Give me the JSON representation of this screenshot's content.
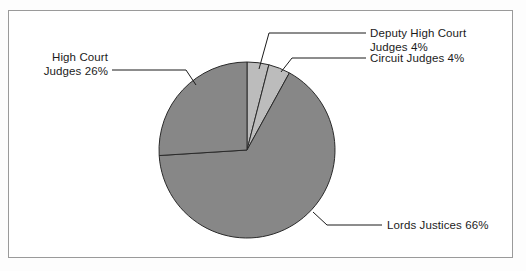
{
  "figure": {
    "background_color": "#ffffff",
    "frame_color": "#9a9a9a"
  },
  "chart_data": {
    "type": "pie",
    "title": "",
    "subtitle": "",
    "xlabel": "",
    "ylabel": "",
    "legend_position": "none",
    "grid": false,
    "start_angle_deg": 0,
    "direction": "clockwise",
    "center": {
      "x": 247,
      "y": 150
    },
    "radius": 88,
    "categories": [
      "Deputy High Court Judges",
      "Circuit Judges",
      "Lords Justices",
      "High Court Judges"
    ],
    "values": [
      4,
      4,
      66,
      26
    ],
    "unit": "%",
    "slices": [
      {
        "label": "Deputy High Court Judges",
        "value": 4,
        "value_text": "4%",
        "color": "#bcbcbc",
        "label_line1": "Deputy High Court",
        "label_line2": "Judges 4%"
      },
      {
        "label": "Circuit Judges",
        "value": 4,
        "value_text": "4%",
        "color": "#bcbcbc",
        "label_line1": "Circuit Judges 4%",
        "label_line2": ""
      },
      {
        "label": "Lords Justices",
        "value": 66,
        "value_text": "66%",
        "color": "#878787",
        "label_line1": "Lords Justices 66%",
        "label_line2": ""
      },
      {
        "label": "High Court Judges",
        "value": 26,
        "value_text": "26%",
        "color": "#878787",
        "label_line1": "High Court",
        "label_line2": "Judges 26%"
      }
    ]
  },
  "labels": {
    "deputy_high_court_line1": "Deputy High Court",
    "deputy_high_court_line2": "Judges 4%",
    "circuit_judges": "Circuit Judges 4%",
    "lords_justices": "Lords Justices 66%",
    "high_court_line1": "High Court",
    "high_court_line2": "Judges 26%"
  }
}
